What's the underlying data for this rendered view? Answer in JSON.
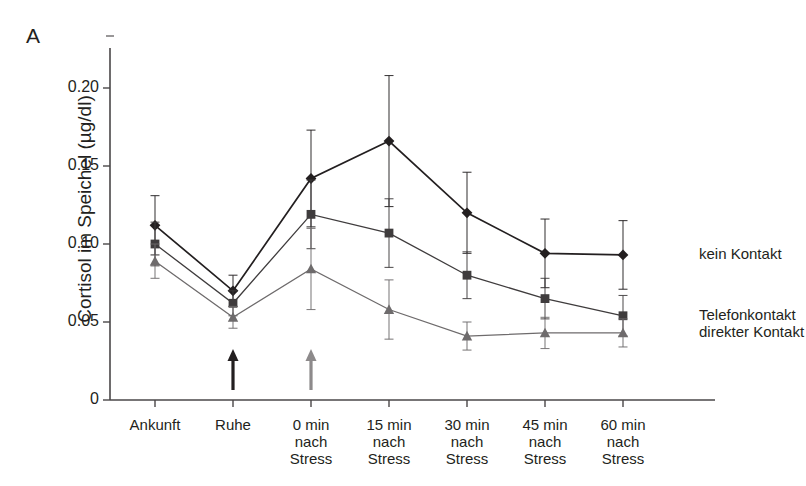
{
  "panel": {
    "label": "A"
  },
  "chart_data": {
    "type": "line",
    "title": "",
    "subtitle": "",
    "xlabel": "",
    "ylabel": "Cortisol im Speichel (µg/dl)",
    "categories": [
      "Ankunft",
      "Ruhe",
      "0 min\nnach\nStress",
      "15 min\nnach\nStress",
      "30 min\nnach\nStress",
      "45 min\nnach\nStress",
      "60 min\nnach\nStress"
    ],
    "category_lines": [
      [
        "Ankunft"
      ],
      [
        "Ruhe"
      ],
      [
        "0 min",
        "nach",
        "Stress"
      ],
      [
        "15 min",
        "nach",
        "Stress"
      ],
      [
        "30 min",
        "nach",
        "Stress"
      ],
      [
        "45 min",
        "nach",
        "Stress"
      ],
      [
        "60 min",
        "nach",
        "Stress"
      ]
    ],
    "ylim": [
      0,
      0.215
    ],
    "yticks": [
      0,
      0.05,
      0.1,
      0.15,
      0.2
    ],
    "ytick_labels": [
      "0",
      "0.05",
      "0.10",
      "0.15",
      "0.20"
    ],
    "grid": false,
    "legend_position": "right-inline",
    "series": [
      {
        "name": "kein Kontakt",
        "marker": "diamond",
        "color": "#231f20",
        "values": [
          0.112,
          0.07,
          0.142,
          0.166,
          0.12,
          0.094,
          0.093
        ],
        "errors": [
          0.019,
          0.01,
          0.031,
          0.042,
          0.026,
          0.022,
          0.022
        ]
      },
      {
        "name": "Telefonkontakt",
        "marker": "square",
        "color": "#3f3c3d",
        "values": [
          0.1,
          0.062,
          0.119,
          0.107,
          0.08,
          0.065,
          0.054
        ],
        "errors": [
          0.014,
          0.008,
          0.022,
          0.022,
          0.015,
          0.013,
          0.013
        ]
      },
      {
        "name": "direkter Kontakt",
        "marker": "triangle",
        "color": "#6e6b6c",
        "values": [
          0.089,
          0.053,
          0.084,
          0.058,
          0.041,
          0.043,
          0.043
        ],
        "errors": [
          0.011,
          0.007,
          0.026,
          0.019,
          0.009,
          0.01,
          0.009
        ]
      }
    ],
    "annotations": [
      {
        "name": "arrow-ruhe",
        "category_index": 1,
        "style": "dark-up-arrow"
      },
      {
        "name": "arrow-stress",
        "category_index": 2,
        "style": "gray-up-arrow"
      }
    ]
  }
}
